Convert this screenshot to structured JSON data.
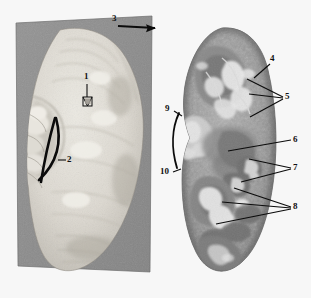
{
  "figure": {
    "background_color": "#f7f7f7",
    "panel_gray": "#8d8d8d",
    "label_color": "#111111"
  },
  "left_panel": {
    "name": "whole-kidney-photograph",
    "description": "Pale whole kidney specimen on gray card",
    "background_color": "#8d8d8d",
    "specimen_color": "#d9d6cf"
  },
  "right_panel": {
    "name": "sectioned-kidney-photograph",
    "description": "Sectioned kidney specimen showing internal structure",
    "specimen_color": "#9a9a9a"
  },
  "labels": [
    {
      "id": "1",
      "text": "1",
      "x": 86,
      "y": 78
    },
    {
      "id": "2",
      "text": "2",
      "x": 68,
      "y": 158
    },
    {
      "id": "3",
      "text": "3",
      "x": 114,
      "y": 18
    },
    {
      "id": "4",
      "text": "4",
      "x": 272,
      "y": 58
    },
    {
      "id": "5",
      "text": "5",
      "x": 286,
      "y": 95
    },
    {
      "id": "6",
      "text": "6",
      "x": 294,
      "y": 138
    },
    {
      "id": "7",
      "text": "7",
      "x": 294,
      "y": 166
    },
    {
      "id": "8",
      "text": "8",
      "x": 294,
      "y": 205
    },
    {
      "id": "9",
      "text": "9",
      "x": 166,
      "y": 108
    },
    {
      "id": "10",
      "text": "10",
      "x": 163,
      "y": 172
    }
  ]
}
